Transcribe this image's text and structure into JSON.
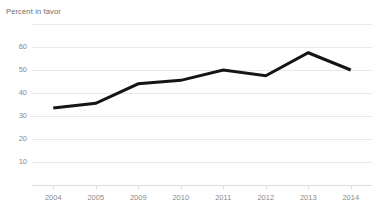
{
  "chart_data": {
    "type": "line",
    "title": "",
    "subtitle": "",
    "xlabel": "",
    "ylabel": "Percent in favor",
    "categories": [
      "2004",
      "2005",
      "2009",
      "2010",
      "2011",
      "2012",
      "2013",
      "2014"
    ],
    "values": [
      33.5,
      35.5,
      44,
      45.5,
      50,
      47.5,
      57.5,
      50
    ],
    "series": [
      {
        "name": "Percent in favor",
        "values": [
          33.5,
          35.5,
          44,
          45.5,
          50,
          47.5,
          57.5,
          50
        ],
        "color": "#151515"
      }
    ],
    "ylim": [
      0,
      70
    ],
    "yticks": [
      10,
      20,
      30,
      40,
      50,
      60
    ],
    "ytick_labels": [
      "10",
      "20",
      "30",
      "40",
      "50",
      "60"
    ],
    "gridlines": [
      0,
      10,
      20,
      30,
      40,
      50,
      60,
      70
    ],
    "grid": true,
    "legend": "none",
    "legend_position": "none",
    "annotations": []
  },
  "colors": {
    "background": "#ffffff",
    "line": "#151515",
    "gridline": "#e9e9e9",
    "axis": "#dcdcdc",
    "tick_text": "#8a8a8a",
    "axis_title_text": "#6d6d6d"
  }
}
